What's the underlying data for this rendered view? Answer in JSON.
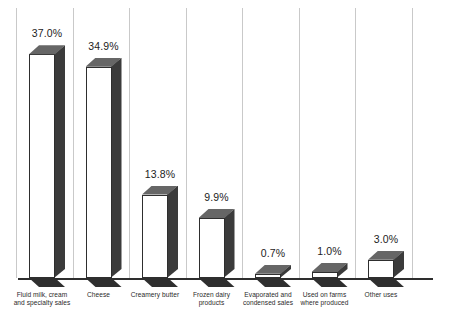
{
  "chart_data": {
    "type": "bar",
    "title": "",
    "subtitle": "",
    "xlabel": "",
    "ylabel": "",
    "grid": false,
    "legend": "none",
    "ylim": [
      0,
      40
    ],
    "categories": [
      "Fluid milk, cream\nand specialty sales",
      "Cheese",
      "Creamery butter",
      "Frozen dairy\nproducts",
      "Evaporated and\ncondensed sales",
      "Used on farms\nwhere produced",
      "Other uses"
    ],
    "values": [
      37.0,
      34.9,
      13.8,
      9.9,
      0.7,
      1.0,
      3.0
    ],
    "value_labels": [
      "37.0%",
      "34.9%",
      "13.8%",
      "9.9%",
      "0.7%",
      "1.0%",
      "3.0%"
    ],
    "colors": {
      "bar_front": "#ffffff",
      "bar_side": "#3b3b3b",
      "bar_top": "#666666",
      "bar_outline": "#2e2e2e",
      "base_plate": "#2f2f2f",
      "background": "#ffffff",
      "text": "#1c1c1c"
    }
  }
}
